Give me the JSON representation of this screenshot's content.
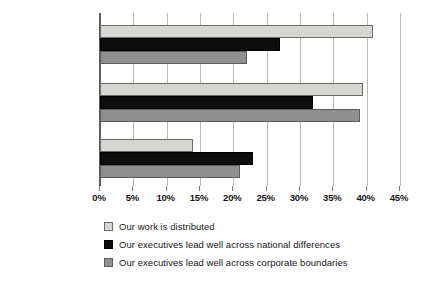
{
  "chart_data": {
    "type": "bar",
    "orientation": "horizontal",
    "title": "",
    "subtitle": "",
    "xlabel": "",
    "ylabel": "",
    "xlim": [
      0,
      45
    ],
    "tick_labels": [
      "0%",
      "5%",
      "10%",
      "15%",
      "20%",
      "25%",
      "30%",
      "35%",
      "40%",
      "45%"
    ],
    "tick_values": [
      0,
      5,
      10,
      15,
      20,
      25,
      30,
      35,
      40,
      45
    ],
    "grid": true,
    "legend_position": "bottom-left",
    "categories": [
      "Strongly agree",
      "Agree",
      "Somewhat agree"
    ],
    "series": [
      {
        "name": "Our work is distributed",
        "color": "#d6d6d3",
        "values": [
          41,
          39.5,
          14
        ]
      },
      {
        "name": "Our executives lead well across national differences",
        "color": "#0d0d0d",
        "values": [
          27,
          32,
          23
        ]
      },
      {
        "name": "Our executives lead well across corporate boundaries",
        "color": "#8f8f8f",
        "values": [
          22,
          39,
          21
        ]
      }
    ]
  },
  "legend": {
    "items": [
      {
        "label": "Our work is distributed",
        "swatch": "legend-swatch-light"
      },
      {
        "label": "Our executives lead well across national differences",
        "swatch": "legend-swatch-black"
      },
      {
        "label": "Our executives lead well across corporate boundaries",
        "swatch": "legend-swatch-gray"
      }
    ]
  }
}
